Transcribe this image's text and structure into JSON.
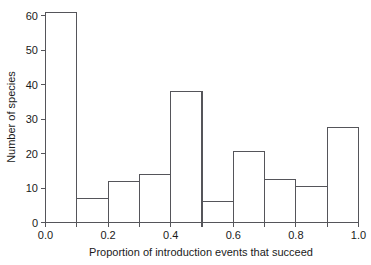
{
  "chart_data": {
    "type": "bar",
    "title": "",
    "xlabel": "Proportion of introduction events that succeed",
    "ylabel": "Number of species",
    "categories": [
      "0.0-0.1",
      "0.1-0.2",
      "0.2-0.3",
      "0.3-0.4",
      "0.4-0.5",
      "0.5-0.6",
      "0.6-0.7",
      "0.7-0.8",
      "0.8-0.9",
      "0.9-1.0"
    ],
    "bin_edges": [
      0.0,
      0.1,
      0.2,
      0.3,
      0.4,
      0.5,
      0.6,
      0.7,
      0.8,
      0.9,
      1.0
    ],
    "values": [
      61,
      7,
      12,
      14,
      38,
      6,
      20.5,
      12.5,
      10.5,
      27.5
    ],
    "xlim": [
      0.0,
      1.0
    ],
    "ylim": [
      0,
      61
    ],
    "xticks": [
      0.0,
      0.2,
      0.4,
      0.6,
      0.8,
      1.0
    ],
    "xtick_labels": [
      "0.0",
      "0.2",
      "0.4",
      "0.6",
      "0.8",
      "1.0"
    ],
    "xminor_ticks": [
      0.1,
      0.3,
      0.5,
      0.7,
      0.9
    ],
    "yticks": [
      0,
      10,
      20,
      30,
      40,
      50,
      60
    ],
    "ytick_labels": [
      "0",
      "10",
      "20",
      "30",
      "40",
      "50",
      "60"
    ],
    "grid": false,
    "legend": "none",
    "bar_fill": "#ffffff",
    "bar_stroke": "#55555a",
    "axis_color": "#55555a",
    "background": "#ffffff"
  }
}
